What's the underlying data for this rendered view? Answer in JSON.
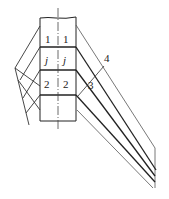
{
  "diagram": {
    "type": "technical-line-drawing",
    "labels": {
      "row1_left": "1",
      "row1_right": "1",
      "rowj_left": "j",
      "rowj_right": "j",
      "row2_left": "2",
      "row2_right": "2",
      "callout_3": "3",
      "callout_4": "4"
    },
    "colors": {
      "line": "#222222",
      "thin_line": "#555555",
      "background": "#ffffff"
    }
  }
}
